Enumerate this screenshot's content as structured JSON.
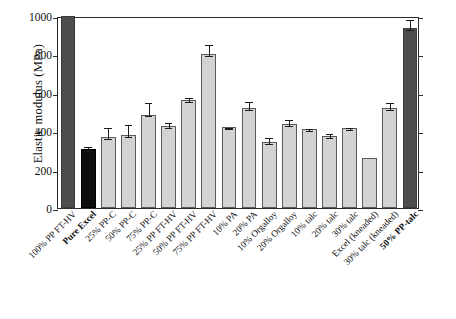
{
  "chart_data": {
    "type": "bar",
    "title": "",
    "xlabel": "",
    "ylabel": "Elastic modulus (MPa)",
    "ylim": [
      0,
      1000
    ],
    "yticks": [
      0,
      200,
      400,
      600,
      800,
      1000
    ],
    "grid": false,
    "legend": "none",
    "categories": [
      "100% PP FT-HV",
      "Pure Excel",
      "25% PP-C",
      "50% PP-C",
      "75% PP-C",
      "25% PP FT-HV",
      "50% PP FT-HV",
      "75% PP FT-HV",
      "10% PA",
      "20% PA",
      "10% Orgalloy",
      "20% Orgalloy",
      "10% talc",
      "20% talc",
      "30% talc",
      "Excel (kneaded)",
      "30% talc (kneaded)",
      "50% PP-talc"
    ],
    "values": [
      1000,
      305,
      370,
      380,
      487,
      425,
      560,
      800,
      420,
      520,
      345,
      435,
      412,
      375,
      415,
      258,
      520,
      935
    ],
    "errors": [
      0,
      22,
      55,
      63,
      70,
      30,
      25,
      60,
      5,
      45,
      30,
      32,
      8,
      22,
      14,
      0,
      38,
      55
    ],
    "bar_styles": [
      "dark",
      "black",
      "light",
      "light",
      "light",
      "light",
      "light",
      "light",
      "light",
      "light",
      "light",
      "light",
      "light",
      "light",
      "light",
      "light",
      "light",
      "dark"
    ],
    "bold_labels": [
      "Pure Excel",
      "50% PP-talc"
    ],
    "colors": {
      "light_bar": "#d3d3d3",
      "dark_bar": "#4d4d4d",
      "black_bar": "#0d0d0d",
      "axis": "#2b2b2b"
    }
  }
}
